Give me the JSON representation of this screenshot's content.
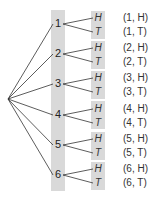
{
  "diagram": {
    "type": "tree",
    "first_stage": [
      "1",
      "2",
      "3",
      "4",
      "5",
      "6"
    ],
    "second_stage": [
      "H",
      "T"
    ],
    "outcomes": [
      {
        "die": "1",
        "coin_h": "H",
        "coin_t": "T",
        "out_h": "(1, H)",
        "out_t": "(1, T)"
      },
      {
        "die": "2",
        "coin_h": "H",
        "coin_t": "T",
        "out_h": "(2, H)",
        "out_t": "(2, T)"
      },
      {
        "die": "3",
        "coin_h": "H",
        "coin_t": "T",
        "out_h": "(3, H)",
        "out_t": "(3, T)"
      },
      {
        "die": "4",
        "coin_h": "H",
        "coin_t": "T",
        "out_h": "(4, H)",
        "out_t": "(4, T)"
      },
      {
        "die": "5",
        "coin_h": "H",
        "coin_t": "T",
        "out_h": "(5, H)",
        "out_t": "(5, T)"
      },
      {
        "die": "6",
        "coin_h": "H",
        "coin_t": "T",
        "out_h": "(6, H)",
        "out_t": "(6, T)"
      }
    ],
    "colors": {
      "column": "#d9d9d9",
      "line": "#333333"
    }
  }
}
